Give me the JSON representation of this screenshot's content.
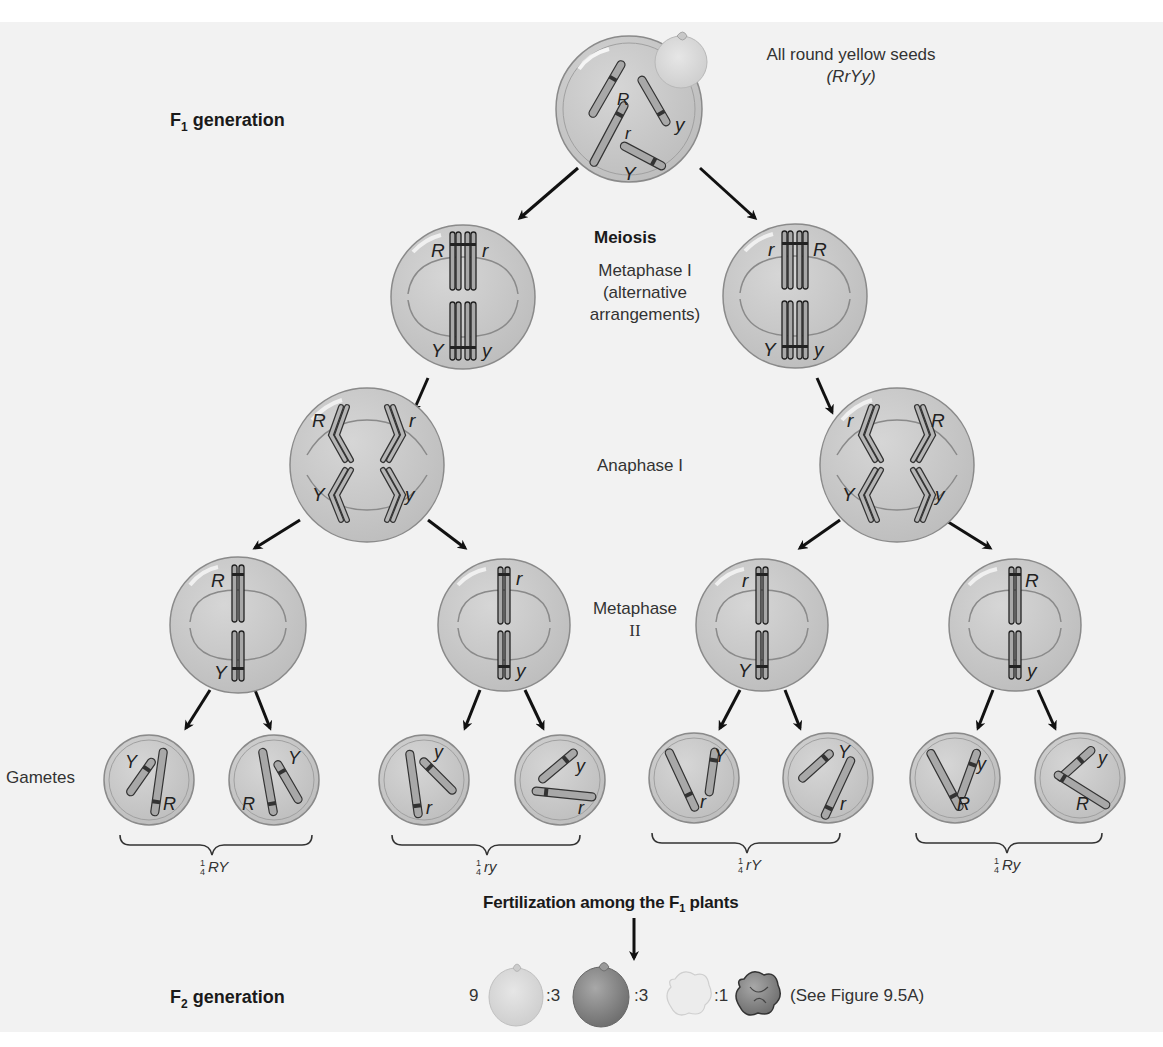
{
  "labels": {
    "f1_generation": {
      "text": "F",
      "sub": "1",
      "rest": " generation"
    },
    "f2_generation": {
      "text": "F",
      "sub": "2",
      "rest": " generation"
    },
    "parent_caption_line1": "All round yellow seeds",
    "parent_caption_line2": "(RrYy)",
    "meiosis": "Meiosis",
    "metaphase1_line1": "Metaphase I",
    "metaphase1_line2": "(alternative",
    "metaphase1_line3": "arrangements)",
    "anaphase1": "Anaphase I",
    "metaphase2_line1": "Metaphase",
    "metaphase2_line2": "II",
    "gametes": "Gametes",
    "fertilization": {
      "text": "Fertilization among the F",
      "sub": "1",
      "rest": " plants"
    },
    "see_figure": "(See Figure 9.5A)"
  },
  "parent_cell": {
    "alleles": [
      "R",
      "r",
      "Y",
      "y"
    ]
  },
  "metaphase1": [
    {
      "top_left": "R",
      "top_right": "r",
      "bottom_left": "Y",
      "bottom_right": "y"
    },
    {
      "top_left": "r",
      "top_right": "R",
      "bottom_left": "Y",
      "bottom_right": "y"
    }
  ],
  "anaphase1": [
    {
      "top_left": "R",
      "top_right": "r",
      "bottom_left": "Y",
      "bottom_right": "y"
    },
    {
      "top_left": "r",
      "top_right": "R",
      "bottom_left": "Y",
      "bottom_right": "y"
    }
  ],
  "metaphase2": [
    {
      "top": "R",
      "bottom": "Y"
    },
    {
      "top": "r",
      "bottom": "y"
    },
    {
      "top": "r",
      "bottom": "Y"
    },
    {
      "top": "R",
      "bottom": "y"
    }
  ],
  "gametes": [
    {
      "a": "Y",
      "b": "R"
    },
    {
      "a": "Y",
      "b": "R"
    },
    {
      "a": "y",
      "b": "r"
    },
    {
      "a": "y",
      "b": "r"
    },
    {
      "a": "Y",
      "b": "r"
    },
    {
      "a": "Y",
      "b": "r"
    },
    {
      "a": "y",
      "b": "R"
    },
    {
      "a": "y",
      "b": "R"
    }
  ],
  "gamete_groups": [
    {
      "num": "1",
      "den": "4",
      "genotype": "RY"
    },
    {
      "num": "1",
      "den": "4",
      "genotype": "ry"
    },
    {
      "num": "1",
      "den": "4",
      "genotype": "rY"
    },
    {
      "num": "1",
      "den": "4",
      "genotype": "Ry"
    }
  ],
  "f2_ratio": [
    {
      "count": "9",
      "seed": "round yellow"
    },
    {
      "count": ":3",
      "seed": "round green"
    },
    {
      "count": ":3",
      "seed": "wrinkled yellow"
    },
    {
      "count": ":1",
      "seed": "wrinkled green"
    }
  ],
  "colors": {
    "cell_fill": "#c9c9c9",
    "cell_stroke": "#8a8a8a",
    "chromosome": "#a8a8a8",
    "band": "#333333",
    "seed_light": "#d8d8d8",
    "seed_dark": "#8f8f8f"
  }
}
